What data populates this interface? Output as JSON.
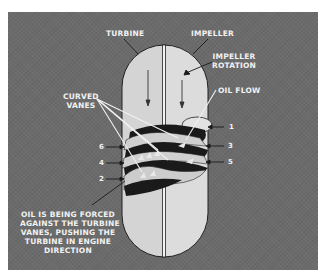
{
  "diagram": {
    "type": "torque-converter-cross-section",
    "colors": {
      "background_panel": "#6b6b6b",
      "capsule_fill": "#d9d9d9",
      "vane_dark": "#1a1a1a",
      "label_text": "#f2f2f2"
    },
    "labels": {
      "turbine": "TURBINE",
      "impeller": "IMPELLER",
      "impeller_rotation_line1": "IMPELLER",
      "impeller_rotation_line2": "ROTATION",
      "oil_flow": "OIL FLOW",
      "curved_vanes_line1": "CURVED",
      "curved_vanes_line2": "VANES",
      "caption_line1": "OIL IS BEING FORCED",
      "caption_line2": "AGAINST THE TURBINE",
      "caption_line3": "VANES, PUSHING THE",
      "caption_line4": "TURBINE IN ENGINE",
      "caption_line5": "DIRECTION"
    },
    "numbers": {
      "right": [
        "1",
        "3",
        "5"
      ],
      "left": [
        "6",
        "4",
        "2"
      ]
    }
  }
}
